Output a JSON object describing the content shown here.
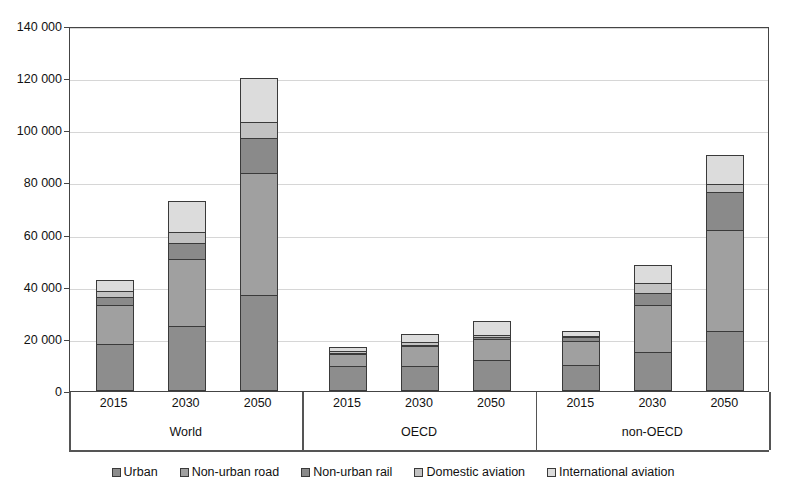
{
  "chart_data": {
    "type": "bar",
    "stacked": true,
    "title": "",
    "subtitle": "",
    "xlabel": "",
    "ylabel": "",
    "ylim": [
      0,
      140000
    ],
    "ytick_step": 20000,
    "ytick_labels": [
      "0",
      "20 000",
      "40 000",
      "60 000",
      "80 000",
      "100 000",
      "120 000",
      "140 000"
    ],
    "ytick_values": [
      0,
      20000,
      40000,
      60000,
      80000,
      100000,
      120000,
      140000
    ],
    "grid": true,
    "legend_position": "bottom",
    "group_labels": [
      "World",
      "OECD",
      "non-OECD"
    ],
    "categories": [
      "2015",
      "2030",
      "2050",
      "2015",
      "2030",
      "2050",
      "2015",
      "2030",
      "2050"
    ],
    "groups": [
      {
        "name": "World",
        "categories": [
          "2015",
          "2030",
          "2050"
        ]
      },
      {
        "name": "OECD",
        "categories": [
          "2015",
          "2030",
          "2050"
        ]
      },
      {
        "name": "non-OECD",
        "categories": [
          "2015",
          "2030",
          "2050"
        ]
      }
    ],
    "series": [
      {
        "name": "Urban",
        "color": "#8d8d8d",
        "values": [
          18000,
          25000,
          37000,
          9500,
          9500,
          12000,
          9800,
          15000,
          23000
        ]
      },
      {
        "name": "Non-urban road",
        "color": "#a0a0a0",
        "values": [
          15500,
          26000,
          47000,
          5000,
          8000,
          8500,
          9700,
          18500,
          39000
        ]
      },
      {
        "name": "Non-urban rail",
        "color": "#8a8a8a",
        "values": [
          3500,
          6500,
          14000,
          1000,
          1000,
          1000,
          1800,
          5000,
          15000
        ]
      },
      {
        "name": "Domestic aviation",
        "color": "#c2c2c2",
        "values": [
          2500,
          4500,
          6500,
          1000,
          1500,
          1000,
          900,
          4000,
          3500
        ]
      },
      {
        "name": "International aviation",
        "color": "#dcdcdc",
        "values": [
          4500,
          12500,
          17000,
          2000,
          3500,
          6000,
          2300,
          7500,
          11500
        ]
      }
    ],
    "totals": [
      44000,
      74500,
      121500,
      18500,
      23500,
      28500,
      24500,
      50000,
      92000
    ]
  },
  "legend": {
    "items": [
      {
        "label": "Urban",
        "color": "#8d8d8d"
      },
      {
        "label": "Non-urban road",
        "color": "#a0a0a0"
      },
      {
        "label": "Non-urban rail",
        "color": "#8a8a8a"
      },
      {
        "label": "Domestic aviation",
        "color": "#c2c2c2"
      },
      {
        "label": "International aviation",
        "color": "#dcdcdc"
      }
    ]
  }
}
